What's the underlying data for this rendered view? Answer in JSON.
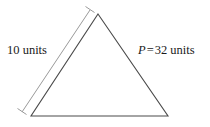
{
  "figure": {
    "type": "geometry-diagram",
    "shape": "triangle",
    "background_color": "#ffffff",
    "stroke_color": "#4a4a4a",
    "measure_line_color": "#9a9a9a",
    "text_color": "#1a1a1a",
    "triangle": {
      "name": "isosceles-triangle",
      "vertices": {
        "apex": [
          98,
          14
        ],
        "bottom_left": [
          31,
          116
        ],
        "bottom_right": [
          168,
          116
        ]
      }
    },
    "measure_line": {
      "name": "left-side-measure",
      "start": [
        90,
        10
      ],
      "end": [
        22,
        112
      ],
      "tick_length": 7
    },
    "labels": {
      "side_length": "10 units",
      "side_length_value": 10,
      "side_length_unit": "units",
      "perimeter_variable": "P",
      "perimeter_equals": "=",
      "perimeter_value": "32",
      "perimeter_unit": "units",
      "perimeter_full": "P = 32 units"
    }
  }
}
